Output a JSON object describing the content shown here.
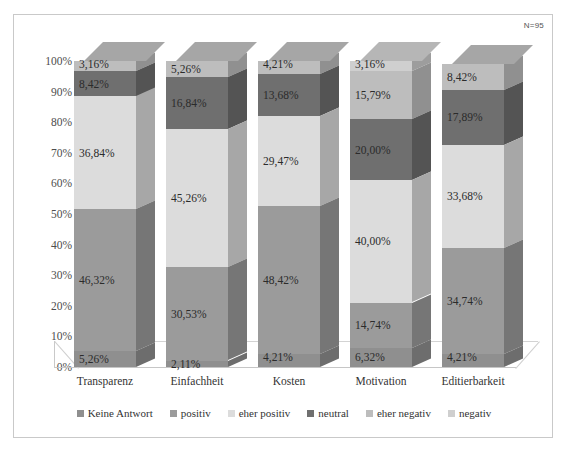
{
  "sample_size_note": "N=95",
  "chart_data": {
    "type": "bar",
    "subtype": "stacked-100-percent-3d",
    "title": "",
    "subtitle": "",
    "xlabel": "",
    "ylabel": "",
    "ylim": [
      0,
      100
    ],
    "grid": false,
    "legend_position": "bottom",
    "annotations": [
      "N=95"
    ],
    "categories": [
      "Transparenz",
      "Einfachheit",
      "Kosten",
      "Motivation",
      "Editierbarkeit"
    ],
    "tick_labels": [
      "0%",
      "10%",
      "20%",
      "30%",
      "40%",
      "50%",
      "60%",
      "70%",
      "80%",
      "90%",
      "100%"
    ],
    "series": [
      {
        "name": "Keine Antwort",
        "color": "#8f8f8f",
        "values": [
          5.26,
          2.11,
          4.21,
          6.32,
          4.21
        ],
        "labels": [
          "5,26%",
          "2,11%",
          "4,21%",
          "6,32%",
          "4,21%"
        ]
      },
      {
        "name": "positiv",
        "color": "#9b9b9b",
        "values": [
          46.32,
          30.53,
          48.42,
          14.74,
          34.74
        ],
        "labels": [
          "46,32%",
          "30,53%",
          "48,42%",
          "14,74%",
          "34,74%"
        ]
      },
      {
        "name": "eher positiv",
        "color": "#dcdcdc",
        "values": [
          36.84,
          45.26,
          29.47,
          40.0,
          33.68
        ],
        "labels": [
          "36,84%",
          "45,26%",
          "29,47%",
          "40,00%",
          "33,68%"
        ]
      },
      {
        "name": "neutral",
        "color": "#6f6f6f",
        "values": [
          8.42,
          16.84,
          13.68,
          20.0,
          17.89
        ],
        "labels": [
          "8,42%",
          "16,84%",
          "13,68%",
          "20,00%",
          "17,89%"
        ]
      },
      {
        "name": "eher negativ",
        "color": "#bdbdbd",
        "values": [
          3.16,
          5.26,
          4.21,
          15.79,
          8.42
        ],
        "labels": [
          "3,16%",
          "5,26%",
          "4,21%",
          "15,79%",
          "8,42%"
        ]
      },
      {
        "name": "negativ",
        "color": "#cfcfcf",
        "values": [
          0.0,
          0.0,
          0.0,
          3.16,
          0.0
        ],
        "labels": [
          "",
          "",
          "",
          "3,16%",
          ""
        ]
      }
    ]
  }
}
